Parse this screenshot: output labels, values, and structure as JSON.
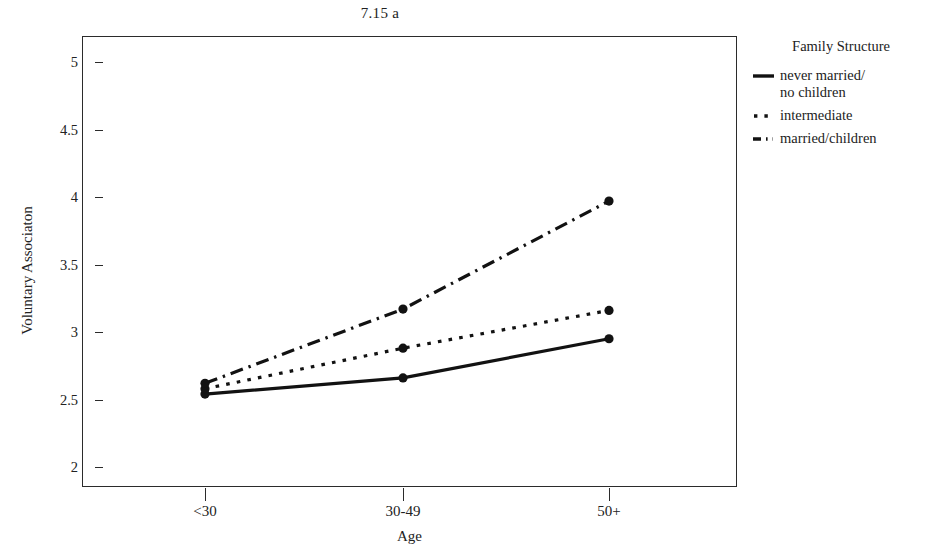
{
  "chart_data": {
    "type": "line",
    "title": "7.15 a",
    "xlabel": "Age",
    "ylabel": "Voluntary Associaton",
    "categories": [
      "<30",
      "30-49",
      "50+"
    ],
    "ylim": [
      2,
      5
    ],
    "yticks": [
      2,
      2.5,
      3,
      3.5,
      4,
      4.5,
      5
    ],
    "ytick_labels": [
      "2",
      "2.5",
      "3",
      "3.5",
      "4",
      "4.5",
      "5"
    ],
    "grid": false,
    "legend_position": "right",
    "legend_title": "Family Structure",
    "markers": "filled-circle",
    "series": [
      {
        "name": "never married/\nno children",
        "style": "solid",
        "color": "#121212",
        "values": [
          2.54,
          2.66,
          2.95
        ]
      },
      {
        "name": "intermediate",
        "style": "dotted",
        "color": "#121212",
        "values": [
          2.58,
          2.88,
          3.16
        ]
      },
      {
        "name": "married/children",
        "style": "dash-dot",
        "color": "#121212",
        "values": [
          2.62,
          3.17,
          3.97
        ]
      }
    ]
  },
  "figure": {
    "title": "7.15 a",
    "axis": {
      "y_title": "Voluntary Associaton",
      "x_title": "Age",
      "y_tick_labels": [
        "5",
        "4.5",
        "4",
        "3.5",
        "3",
        "2.5",
        "2"
      ],
      "x_tick_labels": [
        "<30",
        "30-49",
        "50+"
      ]
    },
    "legend": {
      "title": "Family Structure",
      "entries": [
        {
          "label": "never married/\nno children",
          "key": "solid-line-key"
        },
        {
          "label": "intermediate",
          "key": "dotted-line-key"
        },
        {
          "label": "married/children",
          "key": "dash-dot-line-key"
        }
      ]
    },
    "colors": {
      "background": "#ffffff",
      "frame": "#2b2b2b",
      "ink": "#121212"
    }
  }
}
